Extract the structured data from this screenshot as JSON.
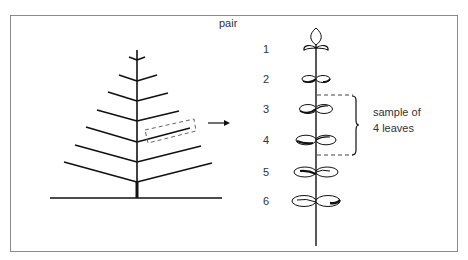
{
  "figure": {
    "left_panel": {
      "description": "tree-branch-schematic",
      "branch_pairs": 7,
      "highlighted_branch_index": 4
    },
    "arrow": "right-arrow",
    "right_panel": {
      "header": "pair",
      "pairs": [
        {
          "label": "1",
          "y": 49
        },
        {
          "label": "2",
          "y": 79
        },
        {
          "label": "3",
          "y": 109
        },
        {
          "label": "4",
          "y": 140
        },
        {
          "label": "5",
          "y": 172
        },
        {
          "label": "6",
          "y": 201
        }
      ],
      "annotation": {
        "line1": "sample of",
        "line2": "4 leaves"
      }
    },
    "colors": {
      "line": "#111111",
      "border": "#8a8a8a",
      "dash": "#666666",
      "text": "#333333"
    }
  }
}
